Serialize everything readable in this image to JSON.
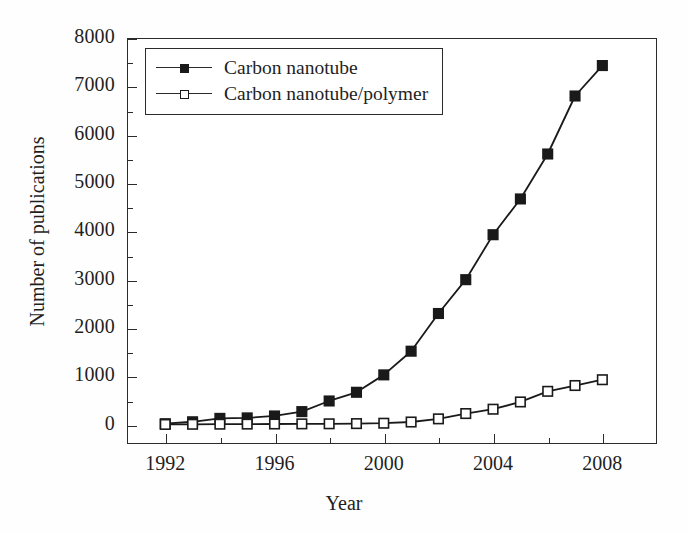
{
  "chart_data": {
    "type": "line",
    "title": "",
    "xlabel": "Year",
    "ylabel": "Number of publications",
    "xlim": [
      1990.6,
      2010.0
    ],
    "ylim": [
      -400,
      8000
    ],
    "grid": false,
    "legend_position": "upper left",
    "x": [
      1992,
      1993,
      1994,
      1995,
      1996,
      1997,
      1998,
      1999,
      2000,
      2001,
      2002,
      2003,
      2004,
      2005,
      2006,
      2007,
      2008
    ],
    "x_major_ticks": [
      1992,
      1996,
      2000,
      2004,
      2008
    ],
    "x_minor_ticks": [
      1994,
      1998,
      2002,
      2006
    ],
    "x_tick_labels": [
      "1992",
      "1996",
      "2000",
      "2004",
      "2008"
    ],
    "y_major_ticks": [
      0,
      1000,
      2000,
      3000,
      4000,
      5000,
      6000,
      7000,
      8000
    ],
    "y_minor_ticks": [
      500,
      1500,
      2500,
      3500,
      4500,
      5500,
      6500,
      7500
    ],
    "y_tick_labels": [
      "0",
      "1000",
      "2000",
      "3000",
      "4000",
      "5000",
      "6000",
      "7000",
      "8000"
    ],
    "series": [
      {
        "name": "Carbon nanotube",
        "marker": "filled-square",
        "color": "#1a1a1a",
        "values": [
          20,
          60,
          130,
          140,
          180,
          270,
          490,
          670,
          1030,
          1520,
          2300,
          3000,
          3930,
          4670,
          5600,
          6800,
          7430
        ]
      },
      {
        "name": "Carbon nanotube/polymer",
        "marker": "open-square",
        "color": "#1a1a1a",
        "values": [
          5,
          8,
          10,
          12,
          14,
          16,
          18,
          22,
          30,
          55,
          120,
          230,
          320,
          470,
          690,
          810,
          930
        ]
      }
    ]
  },
  "legend": {
    "items": [
      {
        "label": "Carbon nanotube"
      },
      {
        "label": "Carbon nanotube/polymer"
      }
    ]
  },
  "axes": {
    "x_title": "Year",
    "y_title": "Number of publications"
  },
  "colors": {
    "line": "#1a1a1a",
    "frame": "#2b2b2b",
    "background": "#ffffff"
  }
}
